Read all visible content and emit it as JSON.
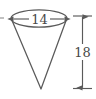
{
  "figure": {
    "type": "geometry-diagram",
    "shape_name": "cone",
    "background_color": "#ffffff",
    "stroke_color": "#5a5a5a",
    "text_color": "#4a4a4a",
    "labels": {
      "diameter": "14",
      "height": "18"
    },
    "annotations": {
      "diameter_dimension_name": "diameter-dimension",
      "height_dimension_name": "height-dimension"
    },
    "geometry": {
      "ellipse_cx": 39,
      "ellipse_cy": 18.5,
      "ellipse_rx": 28,
      "ellipse_ry": 8.5,
      "apex_x": 41,
      "apex_y": 89,
      "height_line_x": 82.5,
      "height_line_top_y": 16,
      "height_line_bottom_y": 88.5,
      "height_tick_half_width": 9.5,
      "diameter_arrow_y": 19,
      "diameter_arrow_left_x": 13,
      "diameter_arrow_right_x": 65,
      "edge_stub_y": 18,
      "edge_stub_x2": 4
    }
  }
}
